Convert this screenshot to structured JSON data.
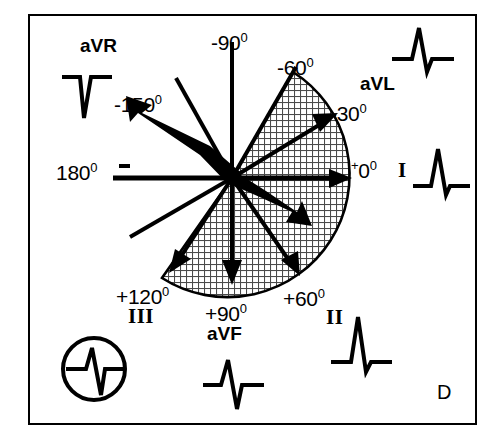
{
  "figure": {
    "panel_letter": "D"
  },
  "angle_labels": [
    {
      "id": "minus-90",
      "text": "-90",
      "degree": "0",
      "prefix": "",
      "x": 211,
      "y": 32,
      "angle": -90
    },
    {
      "id": "minus-60",
      "text": "-60",
      "degree": "0",
      "prefix": "",
      "x": 277,
      "y": 57,
      "angle": -60
    },
    {
      "id": "minus-30",
      "text": "-30",
      "degree": "0",
      "prefix": "",
      "x": 330,
      "y": 103,
      "angle": -30
    },
    {
      "id": "plus-0",
      "text": "0",
      "degree": "0",
      "prefix": "+",
      "x": 351,
      "y": 162,
      "angle": 0
    },
    {
      "id": "plus-60",
      "text": "+60",
      "degree": "0",
      "prefix": "",
      "x": 283,
      "y": 288,
      "angle": 60
    },
    {
      "id": "plus-90",
      "text": "+90",
      "degree": "0",
      "prefix": "",
      "x": 205,
      "y": 303,
      "angle": 90
    },
    {
      "id": "plus-120",
      "text": "+120",
      "degree": "0",
      "prefix": "",
      "x": 116,
      "y": 286,
      "angle": 120
    },
    {
      "id": "minus-150",
      "text": "-150",
      "degree": "0",
      "prefix": "",
      "x": 114,
      "y": 94,
      "angle": -150
    },
    {
      "id": "one-eighty",
      "text": "180",
      "degree": "0",
      "prefix": "",
      "x": 56,
      "y": 162,
      "angle": 180
    }
  ],
  "lead_labels": [
    {
      "id": "aVR",
      "text": "aVR",
      "x": 80,
      "y": 36,
      "style": "bold"
    },
    {
      "id": "aVL",
      "text": "aVL",
      "x": 360,
      "y": 74,
      "style": "bold"
    },
    {
      "id": "aVF",
      "text": "aVF",
      "x": 207,
      "y": 324,
      "style": "bold"
    },
    {
      "id": "I",
      "text": "I",
      "x": 398,
      "y": 160,
      "style": "roman"
    },
    {
      "id": "II",
      "text": "II",
      "x": 326,
      "y": 307,
      "style": "roman"
    },
    {
      "id": "III",
      "text": "III",
      "x": 128,
      "y": 306,
      "style": "roman"
    }
  ],
  "ecg_traces": [
    {
      "id": "aVR-trace",
      "lead": "aVR",
      "morphology": "QS-deep-negative",
      "circled": false
    },
    {
      "id": "aVL-trace",
      "lead": "aVL",
      "morphology": "Rs-tall-R",
      "circled": false
    },
    {
      "id": "I-trace",
      "lead": "I",
      "morphology": "Rs-tall-R",
      "circled": false
    },
    {
      "id": "II-trace",
      "lead": "II",
      "morphology": "Rs-tall-R",
      "circled": false
    },
    {
      "id": "aVF-trace",
      "lead": "aVF",
      "morphology": "RS-deeper-S",
      "circled": false
    },
    {
      "id": "III-trace",
      "lead": "III",
      "morphology": "RS-deeper-S",
      "circled": true
    }
  ],
  "axis_lines": [
    {
      "id": "axis--90",
      "angle": -90,
      "arrow": false
    },
    {
      "id": "axis--60",
      "angle": -60,
      "arrow": false
    },
    {
      "id": "axis--30",
      "angle": -30,
      "arrow": true
    },
    {
      "id": "axis-0",
      "angle": 0,
      "arrow": true
    },
    {
      "id": "axis-60",
      "angle": 60,
      "arrow": true
    },
    {
      "id": "axis-90",
      "angle": 90,
      "arrow": true
    },
    {
      "id": "axis-120",
      "angle": 120,
      "arrow": true
    },
    {
      "id": "axis-150",
      "angle": 150,
      "arrow": false
    },
    {
      "id": "axis-180",
      "angle": 180,
      "arrow": false
    },
    {
      "id": "axis--150",
      "angle": -150,
      "arrow": false
    }
  ],
  "mean_axis_vectors": [
    {
      "id": "bold-vector-negative",
      "angle": -150,
      "length": 118,
      "label": "negative pole"
    },
    {
      "id": "bold-vector-positive",
      "angle": 37,
      "length": 92,
      "label": "positive pole"
    }
  ],
  "shaded_sector": {
    "id": "normal-axis-sector",
    "start_angle": -60,
    "end_angle": 125,
    "fill": "crosshatch",
    "radius": 122
  },
  "polarity_markers": [
    {
      "id": "negative-marker",
      "symbol": "-",
      "x": 119,
      "y": 164
    }
  ],
  "colors": {
    "ink": "#000000",
    "background": "#ffffff",
    "hatch": "#6e6e6e"
  }
}
